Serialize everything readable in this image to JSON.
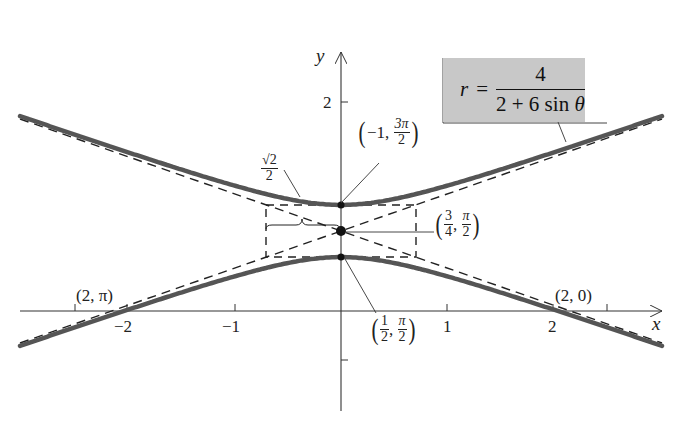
{
  "equation": {
    "lhs": "r",
    "equals": "=",
    "numerator": "4",
    "denominator_a": "2 + 6 sin ",
    "denominator_theta": "θ"
  },
  "axes": {
    "x_label": "x",
    "y_label": "y",
    "x_ticks": [
      "−2",
      "−1",
      "1",
      "2"
    ],
    "y_ticks": [
      "2"
    ]
  },
  "annotations": {
    "top_vertex": {
      "open": "(",
      "first": "−1,",
      "num": "3π",
      "den": "2",
      "close": ")"
    },
    "center": {
      "open": "(",
      "num1": "3",
      "den1": "4",
      "num2": "π",
      "den2": "2",
      "close": ")"
    },
    "bottom_vertex": {
      "open": "(",
      "num1": "1",
      "den1": "2",
      "num2": "π",
      "den2": "2",
      "close": ")"
    },
    "left_intercept": "(2, π)",
    "right_intercept": "(2, 0)",
    "half_width": {
      "num": "√2",
      "den": "2"
    }
  },
  "colors": {
    "curve": "#555555",
    "box_fill": "#c8c8c8",
    "line": "#222222"
  }
}
